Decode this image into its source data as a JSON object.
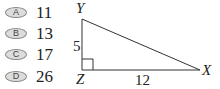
{
  "question": {
    "choices": [
      {
        "letter": "A",
        "value": "11"
      },
      {
        "letter": "B",
        "value": "13"
      },
      {
        "letter": "C",
        "value": "17"
      },
      {
        "letter": "D",
        "value": "26"
      }
    ]
  },
  "figure": {
    "type": "right-triangle",
    "vertices": {
      "top": "Y",
      "right_angle": "Z",
      "right": "X"
    },
    "sides": {
      "YZ": "5",
      "ZX": "12"
    },
    "right_angle_marker_at": "Z"
  }
}
